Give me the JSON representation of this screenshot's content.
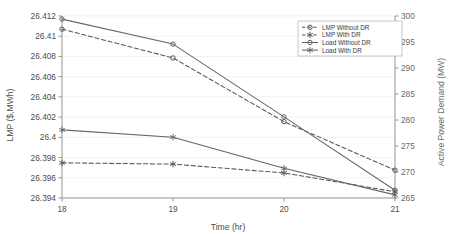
{
  "chart_data": {
    "type": "line",
    "title": "",
    "xlabel": "Time (hr)",
    "ylabel": "LMP ($,MWh)",
    "y2label": "Active Power Demand (MW)",
    "x": [
      18,
      19,
      20,
      21
    ],
    "xtick_labels": [
      "18",
      "19",
      "20",
      "21"
    ],
    "xlim": [
      18,
      21
    ],
    "ylim": [
      26.394,
      26.412
    ],
    "ytick_labels": [
      "26.394",
      "26.396",
      "26.398",
      "26.4",
      "26.402",
      "26.404",
      "26.406",
      "26.408",
      "26.41",
      "26.412"
    ],
    "ytick_values": [
      26.394,
      26.396,
      26.398,
      26.4,
      26.402,
      26.404,
      26.406,
      26.408,
      26.41,
      26.412
    ],
    "y2lim": [
      265,
      300
    ],
    "y2tick_labels": [
      "265",
      "270",
      "275",
      "280",
      "285",
      "290",
      "295",
      "300"
    ],
    "y2tick_values": [
      265,
      270,
      275,
      280,
      285,
      290,
      295,
      300
    ],
    "grid": true,
    "legend_position": "top-right",
    "series": [
      {
        "name": "LMP Without DR",
        "axis": "left",
        "style": "dashed",
        "marker": "circle",
        "color": "#555555",
        "values": [
          26.4107,
          26.40785,
          26.40155,
          26.39675
        ]
      },
      {
        "name": "LMP With DR",
        "axis": "left",
        "style": "dashed",
        "marker": "star",
        "color": "#555555",
        "values": [
          26.39748,
          26.39735,
          26.39648,
          26.39462
        ]
      },
      {
        "name": "Load Without DR",
        "axis": "right",
        "style": "solid",
        "marker": "circle",
        "color": "#666666",
        "values": [
          299.4,
          294.6,
          280.6,
          266.5
        ]
      },
      {
        "name": "Load With DR",
        "axis": "right",
        "style": "solid",
        "marker": "star",
        "color": "#666666",
        "values": [
          278.1,
          276.7,
          270.7,
          265.6
        ]
      }
    ]
  }
}
